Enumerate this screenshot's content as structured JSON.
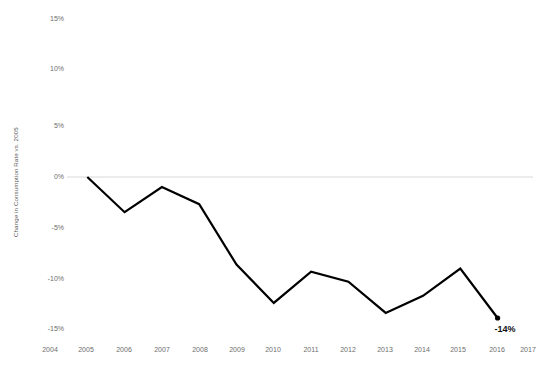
{
  "chart_data": {
    "type": "line",
    "title": "",
    "xlabel": "",
    "ylabel": "Change in Consumption Rate vs. 2005",
    "x": [
      2005,
      2006,
      2007,
      2008,
      2009,
      2010,
      2011,
      2012,
      2013,
      2014,
      2015,
      2016
    ],
    "values": [
      0,
      -3.5,
      -1,
      -2.7,
      -8.7,
      -12.5,
      -9.4,
      -10.4,
      -13.5,
      -11.8,
      -9.1,
      -14
    ],
    "series": [
      {
        "name": "Change in Consumption Rate vs. 2005",
        "values": [
          0,
          -3.5,
          -1,
          -2.7,
          -8.7,
          -12.5,
          -9.4,
          -10.4,
          -13.5,
          -11.8,
          -9.1,
          -14
        ]
      }
    ],
    "x_tick_labels": [
      "2004",
      "2005",
      "2006",
      "2007",
      "2008",
      "2009",
      "2010",
      "2011",
      "2012",
      "2013",
      "2014",
      "2015",
      "2016",
      "2017"
    ],
    "y_tick_labels": [
      "15%",
      "10%",
      "5%",
      "0%",
      "-5%",
      "-10%",
      "-15%"
    ],
    "y_tick_values": [
      15,
      10,
      5,
      0,
      -5,
      -10,
      -15
    ],
    "ylim": [
      -15,
      15
    ],
    "xlim": [
      2004,
      2017
    ],
    "grid": "zero-line-only",
    "legend": "none",
    "annotations": [
      {
        "label": "-14%",
        "x": 2016,
        "y": -14
      }
    ],
    "colors": {
      "line": "#000000",
      "marker": "#000000",
      "zero_gridline": "#d9d9d9",
      "tick_text": "#6d6d6d",
      "axis_title_text": "#5a5a5a",
      "annotation_text": "#111111",
      "background": "#ffffff"
    }
  }
}
